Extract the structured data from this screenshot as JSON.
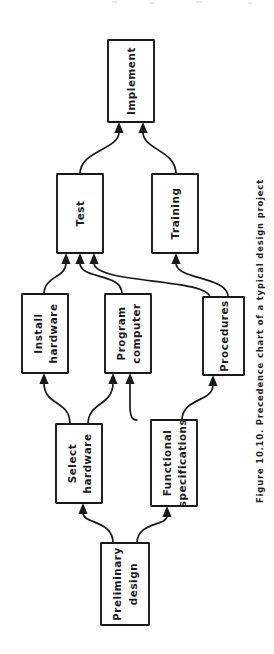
{
  "figure": {
    "caption": "Figure 10.10.  Precedence chart of a typical design project",
    "orientation": "rotated-90-ccw",
    "background_color": "#ffffff",
    "line_color": "#17181a",
    "text_color": "#1a1b1d"
  },
  "diagram": {
    "type": "precedence-chart",
    "nodes": [
      {
        "id": "implement",
        "label": "Implement",
        "label_line1": "Implement",
        "label_line2": "",
        "x": 108,
        "y": 40,
        "w": 46,
        "h": 82
      },
      {
        "id": "test",
        "label": "Test",
        "label_line1": "Test",
        "label_line2": "",
        "x": 57,
        "y": 174,
        "w": 46,
        "h": 79
      },
      {
        "id": "training",
        "label": "Training",
        "label_line1": "Training",
        "label_line2": "",
        "x": 152,
        "y": 174,
        "w": 46,
        "h": 79
      },
      {
        "id": "install-hw",
        "label": "Install hardware",
        "label_line1": "Install",
        "label_line2": "hardware",
        "x": 22,
        "y": 294,
        "w": 46,
        "h": 79
      },
      {
        "id": "program-comp",
        "label": "Program computer",
        "label_line1": "Program",
        "label_line2": "computer",
        "x": 105,
        "y": 294,
        "w": 46,
        "h": 79
      },
      {
        "id": "procedures",
        "label": "Procedures",
        "label_line1": "Procedures",
        "label_line2": "",
        "x": 203,
        "y": 297,
        "w": 41,
        "h": 78
      },
      {
        "id": "select-hw",
        "label": "Select hardware",
        "label_line1": "Select",
        "label_line2": "hardware",
        "x": 56,
        "y": 424,
        "w": 46,
        "h": 79
      },
      {
        "id": "func-spec",
        "label": "Functional specifications",
        "label_line1": "Functional",
        "label_line2": "specifications",
        "x": 151,
        "y": 420,
        "w": 46,
        "h": 86
      },
      {
        "id": "prelim-design",
        "label": "Preliminary design",
        "label_line1": "Preliminary",
        "label_line2": "design",
        "x": 101,
        "y": 543,
        "w": 48,
        "h": 82
      }
    ],
    "edges": [
      {
        "id": "test-to-implement",
        "from": "test",
        "to": "implement"
      },
      {
        "id": "training-to-implement",
        "from": "training",
        "to": "implement"
      },
      {
        "id": "install-hw-to-test",
        "from": "install-hw",
        "to": "test"
      },
      {
        "id": "program-comp-to-test",
        "from": "program-comp",
        "to": "test"
      },
      {
        "id": "procedures-to-test",
        "from": "procedures",
        "to": "test"
      },
      {
        "id": "procedures-to-training",
        "from": "procedures",
        "to": "training"
      },
      {
        "id": "select-hw-to-install-hw",
        "from": "select-hw",
        "to": "install-hw"
      },
      {
        "id": "select-hw-to-program-comp",
        "from": "select-hw",
        "to": "program-comp"
      },
      {
        "id": "func-spec-to-program-comp",
        "from": "func-spec",
        "to": "program-comp"
      },
      {
        "id": "func-spec-to-procedures",
        "from": "func-spec",
        "to": "procedures"
      },
      {
        "id": "prelim-to-select-hw",
        "from": "prelim-design",
        "to": "select-hw"
      },
      {
        "id": "prelim-to-func-spec",
        "from": "prelim-design",
        "to": "func-spec"
      }
    ]
  }
}
